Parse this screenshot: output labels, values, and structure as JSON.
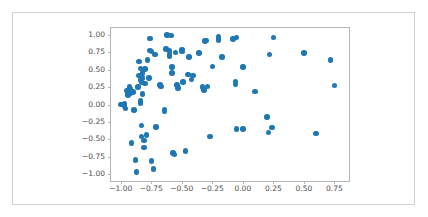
{
  "figure": {
    "width": 428,
    "height": 217,
    "background_color": "#ffffff",
    "border_color": "#d0d0d0",
    "axes_spine_color": "#b5b5b5",
    "tick_label_color": "#4d4d4d"
  },
  "chart_data": {
    "type": "scatter",
    "title": "",
    "xlabel": "",
    "ylabel": "",
    "xlim": [
      -1.08,
      0.87
    ],
    "ylim": [
      -1.1,
      1.1
    ],
    "grid": false,
    "legend": null,
    "marker_color": "#1f77b4",
    "marker_size": 5.5,
    "xticks": [
      -1.0,
      -0.75,
      -0.5,
      -0.25,
      0.0,
      0.25,
      0.5,
      0.75
    ],
    "xtick_labels": [
      "−1.00",
      "−0.75",
      "−0.50",
      "−0.25",
      "0.00",
      "0.25",
      "0.50",
      "0.75"
    ],
    "yticks": [
      1.0,
      0.75,
      0.5,
      0.25,
      0.0,
      -0.25,
      -0.5,
      -0.75,
      -1.0
    ],
    "ytick_labels": [
      "1.00",
      "0.75",
      "0.50",
      "0.25",
      "0.00",
      "−0.25",
      "−0.50",
      "−0.75",
      "−1.00"
    ],
    "series": [
      {
        "name": "points",
        "color": "#1f77b4",
        "points": [
          [
            -1.0,
            0.0
          ],
          [
            -0.99,
            0.0
          ],
          [
            -0.97,
            0.01
          ],
          [
            -0.97,
            -0.03
          ],
          [
            -0.96,
            -0.06
          ],
          [
            -0.95,
            0.2
          ],
          [
            -0.94,
            0.17
          ],
          [
            -0.94,
            0.14
          ],
          [
            -0.93,
            0.25
          ],
          [
            -0.92,
            0.22
          ],
          [
            -0.92,
            0.16
          ],
          [
            -0.91,
            -0.55
          ],
          [
            -0.9,
            0.18
          ],
          [
            -0.89,
            -0.08
          ],
          [
            -0.88,
            -0.8
          ],
          [
            -0.87,
            -0.97
          ],
          [
            -0.86,
            0.25
          ],
          [
            -0.85,
            0.62
          ],
          [
            -0.85,
            0.42
          ],
          [
            -0.84,
            0.52
          ],
          [
            -0.84,
            0.35
          ],
          [
            -0.84,
            0.05
          ],
          [
            -0.84,
            0.02
          ],
          [
            -0.83,
            0.32
          ],
          [
            -0.83,
            -0.3
          ],
          [
            -0.83,
            -0.46
          ],
          [
            -0.82,
            0.45
          ],
          [
            -0.82,
            0.38
          ],
          [
            -0.82,
            0.15
          ],
          [
            -0.81,
            -0.52
          ],
          [
            -0.81,
            -0.62
          ],
          [
            -0.8,
            0.51
          ],
          [
            -0.8,
            0.3
          ],
          [
            -0.79,
            -0.44
          ],
          [
            -0.78,
            0.64
          ],
          [
            -0.77,
            0.38
          ],
          [
            -0.76,
            0.95
          ],
          [
            -0.76,
            0.78
          ],
          [
            -0.75,
            0.76
          ],
          [
            -0.75,
            -0.81
          ],
          [
            -0.73,
            -0.93
          ],
          [
            -0.72,
            0.72
          ],
          [
            -0.71,
            -0.32
          ],
          [
            -0.68,
            0.28
          ],
          [
            -0.67,
            0.26
          ],
          [
            -0.64,
            -0.07
          ],
          [
            -0.64,
            -0.1
          ],
          [
            -0.63,
            0.8
          ],
          [
            -0.62,
            1.0
          ],
          [
            -0.6,
            0.77
          ],
          [
            -0.6,
            0.72
          ],
          [
            -0.6,
            0.7
          ],
          [
            -0.59,
            0.99
          ],
          [
            -0.58,
            0.54
          ],
          [
            -0.58,
            0.45
          ],
          [
            -0.57,
            -0.7
          ],
          [
            -0.56,
            -0.72
          ],
          [
            -0.55,
            0.75
          ],
          [
            -0.54,
            0.28
          ],
          [
            -0.53,
            0.24
          ],
          [
            -0.5,
            0.79
          ],
          [
            -0.5,
            0.76
          ],
          [
            -0.49,
            0.32
          ],
          [
            -0.47,
            -0.67
          ],
          [
            -0.45,
            0.43
          ],
          [
            -0.44,
            0.68
          ],
          [
            -0.42,
            0.36
          ],
          [
            -0.41,
            0.42
          ],
          [
            -0.36,
            0.74
          ],
          [
            -0.33,
            0.25
          ],
          [
            -0.32,
            0.21
          ],
          [
            -0.31,
            0.91
          ],
          [
            -0.3,
            0.92
          ],
          [
            -0.29,
            0.26
          ],
          [
            -0.27,
            -0.46
          ],
          [
            -0.25,
            0.55
          ],
          [
            -0.2,
            0.93
          ],
          [
            -0.2,
            0.97
          ],
          [
            -0.17,
            0.68
          ],
          [
            -0.08,
            0.94
          ],
          [
            -0.06,
            0.33
          ],
          [
            -0.06,
            0.29
          ],
          [
            -0.05,
            0.96
          ],
          [
            -0.05,
            -0.35
          ],
          [
            0.0,
            0.54
          ],
          [
            0.0,
            -0.35
          ],
          [
            0.1,
            0.19
          ],
          [
            0.2,
            -0.18
          ],
          [
            0.21,
            -0.4
          ],
          [
            0.22,
            0.72
          ],
          [
            0.24,
            -0.33
          ],
          [
            0.25,
            0.96
          ],
          [
            0.5,
            0.74
          ],
          [
            0.6,
            -0.42
          ],
          [
            0.72,
            0.64
          ],
          [
            0.75,
            0.27
          ]
        ]
      }
    ]
  }
}
